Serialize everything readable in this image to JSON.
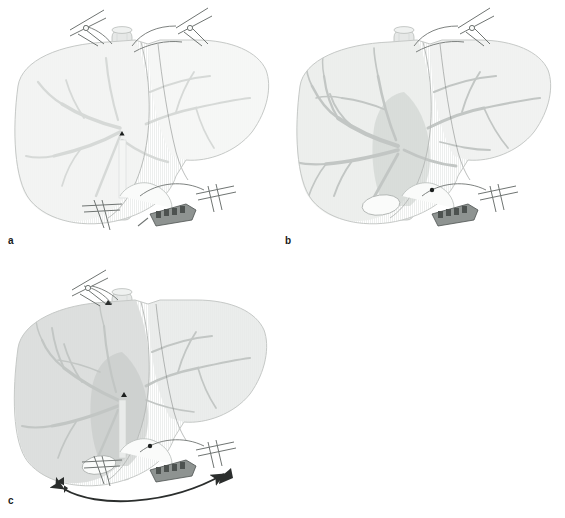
{
  "figure": {
    "type": "medical-illustration",
    "background_color": "#ffffff",
    "width": 565,
    "height": 518,
    "panel_count": 3,
    "layout": "2x2-grid-with-empty-fourth-cell"
  },
  "palette": {
    "liver_pale": "#f2f3f2",
    "liver_light": "#eceeec",
    "liver_mid": "#e2e5e3",
    "liver_congested": "#d9dcda",
    "liver_outline": "#b9bcba",
    "vessel_light": "#d6d9d7",
    "vessel_mid": "#c2c6c4",
    "vessel_dark": "#a8adaa",
    "caudate_shade": "#c9cdcb",
    "ivc_fill": "#e6e8e7",
    "ivc_outline": "#b0b4b2",
    "instrument_line": "#6f7472",
    "instrument_fill": "#fbfcfb",
    "stapler_metal": "#8e9391",
    "stapler_dark": "#4d5250",
    "arrow_dark": "#2b2e2d",
    "marker_dark": "#1c1f1e",
    "label_text": "#1a1a1a",
    "hatch_stroke": "#e9ebea"
  },
  "panels": [
    {
      "id": "a",
      "label": "a",
      "caption_letter": "a",
      "position": {
        "x": 0,
        "y": 0,
        "width": 283,
        "height": 259
      },
      "description": "Liver in situ with hepatic veins clamped; pale uniform parenchyma, faint portal branches, vascular stapler applied to infrahepatic vena cava",
      "liver_tone": "pale",
      "left_lobe_fill": "#f2f3f2",
      "right_lobe_fill": "#f5f6f5",
      "vessel_prominence": "faint",
      "has_caudate_shade": false,
      "has_gallbladder": false,
      "has_motion_arrow": false,
      "instruments": [
        {
          "name": "vascular-clamp-left-hepatic-vein",
          "x": 96,
          "y": 22
        },
        {
          "name": "vascular-clamp-right-hepatic-vein",
          "x": 188,
          "y": 22
        },
        {
          "name": "vascular-clamp-infrahepatic",
          "x": 100,
          "y": 208
        },
        {
          "name": "vascular-stapler",
          "x": 170,
          "y": 212
        },
        {
          "name": "clamp-right-lower",
          "x": 212,
          "y": 196
        }
      ],
      "markers": [
        {
          "name": "needle-entry-marker",
          "x": 123,
          "y": 135
        }
      ]
    },
    {
      "id": "b",
      "label": "b",
      "caption_letter": "b",
      "position": {
        "x": 282,
        "y": 0,
        "width": 283,
        "height": 259
      },
      "description": "Portal venous branching fully opacified in left lobe; darker caudate wedge visible centrally; gallbladder outlined; stapler on vena cava",
      "liver_tone": "light",
      "left_lobe_fill": "#eceeec",
      "right_lobe_fill": "#eff1ef",
      "vessel_prominence": "prominent",
      "has_caudate_shade": true,
      "has_gallbladder": true,
      "has_motion_arrow": false,
      "instruments": [
        {
          "name": "vascular-clamp-right-hepatic-vein",
          "x": 474,
          "y": 22
        },
        {
          "name": "vascular-stapler",
          "x": 452,
          "y": 212
        },
        {
          "name": "clamp-right-lower",
          "x": 494,
          "y": 196
        }
      ],
      "markers": [
        {
          "name": "suture-knot-marker",
          "x": 432,
          "y": 190
        }
      ]
    },
    {
      "id": "c",
      "label": "c",
      "caption_letter": "c",
      "position": {
        "x": 0,
        "y": 259,
        "width": 283,
        "height": 259
      },
      "description": "Congested left lobe with darker parenchyma; caudate wedge shaded; double-headed curved arrow below indicating rotation of the stapler/clamp assembly",
      "liver_tone": "congested",
      "left_lobe_fill": "#d9dcda",
      "right_lobe_fill": "#e8eae9",
      "vessel_prominence": "moderate",
      "has_caudate_shade": true,
      "has_gallbladder": true,
      "has_motion_arrow": true,
      "motion_arrow": {
        "name": "double-headed-rotation-arrow",
        "style": "curved-double-headed",
        "color": "#2b2e2d",
        "from": {
          "x": 58,
          "y": 490
        },
        "to": {
          "x": 228,
          "y": 472
        }
      },
      "instruments": [
        {
          "name": "vascular-clamp-left-hepatic-vein",
          "x": 100,
          "y": 281
        },
        {
          "name": "vascular-clamp-infrahepatic",
          "x": 100,
          "y": 466
        },
        {
          "name": "vascular-stapler",
          "x": 170,
          "y": 468
        },
        {
          "name": "clamp-right-lower",
          "x": 212,
          "y": 452
        }
      ],
      "markers": [
        {
          "name": "transection-marker",
          "x": 128,
          "y": 397
        }
      ]
    }
  ],
  "anatomy_legend": {
    "liver_left_lobe": "left hepatic lobe",
    "liver_right_lobe": "right hepatic lobe",
    "ivc": "inferior vena cava",
    "hepatic_veins": "hepatic veins",
    "portal_branches": "portal venous branches",
    "gallbladder": "gallbladder",
    "caudate": "caudate lobe"
  }
}
